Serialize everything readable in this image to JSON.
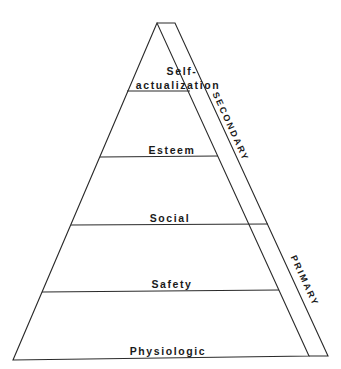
{
  "diagram": {
    "type": "pyramid",
    "levels": [
      {
        "label_line1": "Self-",
        "label_line2": "actualization"
      },
      {
        "label": "Esteem"
      },
      {
        "label": "Social"
      },
      {
        "label": "Safety"
      },
      {
        "label": "Physiologic"
      }
    ],
    "band_labels": {
      "upper": "SECONDARY",
      "lower": "PRIMARY"
    },
    "colors": {
      "line": "#2a2a2a",
      "background": "#ffffff"
    }
  }
}
